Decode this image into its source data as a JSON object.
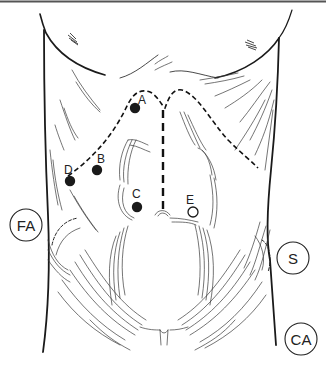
{
  "figure": {
    "colors": {
      "line": "#1a1a1a",
      "hatch": "#3a3a3a",
      "background": "#ffffff",
      "top_border": "#555555"
    }
  },
  "points": [
    {
      "id": "A",
      "label": "A",
      "style": "filled",
      "x": 135,
      "y": 108,
      "lx": 141,
      "ly": 103
    },
    {
      "id": "B",
      "label": "B",
      "style": "filled",
      "x": 97,
      "y": 170,
      "lx": 101,
      "ly": 162
    },
    {
      "id": "C",
      "label": "C",
      "style": "filled",
      "x": 137,
      "y": 207,
      "lx": 136,
      "ly": 197
    },
    {
      "id": "D",
      "label": "D",
      "style": "filled",
      "x": 70,
      "y": 181,
      "lx": 69,
      "ly": 173
    },
    {
      "id": "E",
      "label": "E",
      "style": "open",
      "x": 193,
      "y": 212,
      "lx": 189,
      "ly": 203
    }
  ],
  "regions": [
    {
      "id": "FA",
      "label": "FA",
      "cx": 26,
      "cy": 225,
      "r": 16
    },
    {
      "id": "S",
      "label": "S",
      "cx": 293,
      "cy": 258,
      "r": 16
    },
    {
      "id": "CA",
      "label": "CA",
      "cx": 301,
      "cy": 339,
      "r": 16
    }
  ],
  "incisions": {
    "costal_margin": "dashed",
    "midline": "dashed"
  }
}
